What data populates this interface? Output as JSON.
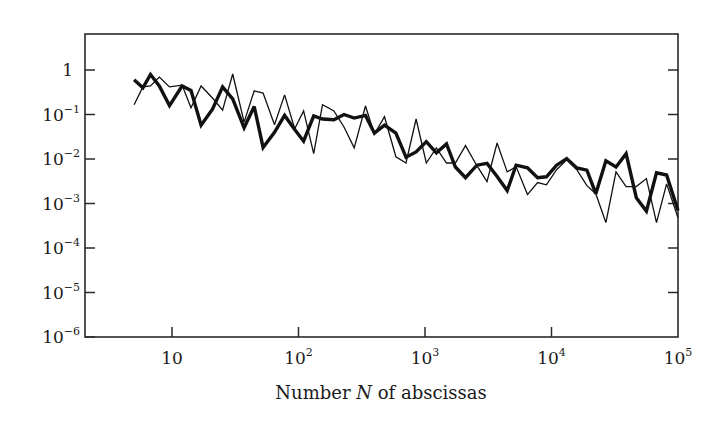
{
  "chart_data": {
    "type": "line",
    "title": "",
    "xlabel": "Number N of abscissas",
    "xlabel_parts": [
      "Number ",
      "N",
      " of abscissas"
    ],
    "ylabel": "",
    "xscale": "log",
    "yscale": "log",
    "xlim": [
      2.6,
      100000
    ],
    "ylim": [
      1e-06,
      6.5
    ],
    "grid": false,
    "legend": null,
    "x_ticks": [
      {
        "value": 1,
        "base": "10",
        "exp": ""
      },
      {
        "value": 2,
        "base": "10",
        "exp": "2"
      },
      {
        "value": 3,
        "base": "10",
        "exp": "3"
      },
      {
        "value": 4,
        "base": "10",
        "exp": "4"
      },
      {
        "value": 5,
        "base": "10",
        "exp": "5"
      }
    ],
    "y_ticks": [
      {
        "value": 0,
        "base": "1",
        "exp": ""
      },
      {
        "value": -1,
        "base": "10",
        "exp": "−1"
      },
      {
        "value": -2,
        "base": "10",
        "exp": "−2"
      },
      {
        "value": -3,
        "base": "10",
        "exp": "−3"
      },
      {
        "value": -4,
        "base": "10",
        "exp": "−4"
      },
      {
        "value": -5,
        "base": "10",
        "exp": "−5"
      },
      {
        "value": -6,
        "base": "10",
        "exp": "−6"
      }
    ],
    "series": [
      {
        "name": "thin",
        "style": "thin",
        "stroke_width": 1.3,
        "log10_x": [
          0.7,
          0.77,
          0.83,
          0.9,
          0.98,
          1.08,
          1.15,
          1.23,
          1.32,
          1.4,
          1.48,
          1.57,
          1.65,
          1.72,
          1.81,
          1.89,
          1.97,
          2.04,
          2.12,
          2.19,
          2.28,
          2.36,
          2.44,
          2.53,
          2.6,
          2.68,
          2.77,
          2.85,
          2.93,
          3.01,
          3.09,
          3.17,
          3.24,
          3.32,
          3.41,
          3.49,
          3.57,
          3.65,
          3.72,
          3.81,
          3.89,
          3.96,
          4.04,
          4.12,
          4.2,
          4.28,
          4.35,
          4.43,
          4.51,
          4.59,
          4.67,
          4.75,
          4.83,
          4.91,
          5.0
        ],
        "log10_y": [
          -0.78,
          -0.38,
          -0.36,
          -0.16,
          -0.38,
          -0.34,
          -0.85,
          -0.36,
          -0.63,
          -0.9,
          -0.09,
          -1.17,
          -0.47,
          -0.52,
          -1.23,
          -0.56,
          -1.32,
          -0.92,
          -1.88,
          -0.78,
          -0.92,
          -1.28,
          -1.75,
          -0.81,
          -1.44,
          -1.05,
          -1.95,
          -2.09,
          -1.1,
          -2.09,
          -1.75,
          -2.09,
          -2.09,
          -1.7,
          -2.15,
          -2.51,
          -1.64,
          -2.29,
          -2.17,
          -2.8,
          -2.53,
          -2.58,
          -2.24,
          -2.02,
          -2.24,
          -2.6,
          -2.78,
          -3.43,
          -2.29,
          -2.62,
          -2.62,
          -2.44,
          -3.43,
          -2.56,
          -3.32
        ]
      },
      {
        "name": "thick",
        "style": "thick",
        "stroke_width": 3.4,
        "log10_x": [
          0.7,
          0.77,
          0.83,
          0.9,
          0.98,
          1.08,
          1.15,
          1.23,
          1.32,
          1.4,
          1.48,
          1.57,
          1.65,
          1.72,
          1.81,
          1.89,
          1.97,
          2.04,
          2.12,
          2.19,
          2.28,
          2.36,
          2.44,
          2.53,
          2.6,
          2.68,
          2.77,
          2.85,
          2.93,
          3.01,
          3.09,
          3.17,
          3.24,
          3.32,
          3.41,
          3.49,
          3.57,
          3.65,
          3.72,
          3.81,
          3.89,
          3.96,
          4.04,
          4.12,
          4.2,
          4.28,
          4.35,
          4.43,
          4.51,
          4.59,
          4.67,
          4.75,
          4.83,
          4.91,
          5.0
        ],
        "log10_y": [
          -0.22,
          -0.4,
          -0.1,
          -0.36,
          -0.8,
          -0.36,
          -0.46,
          -1.24,
          -0.88,
          -0.38,
          -0.65,
          -1.3,
          -0.82,
          -1.74,
          -1.4,
          -1.02,
          -1.34,
          -1.6,
          -1.03,
          -1.1,
          -1.12,
          -1.0,
          -1.08,
          -1.02,
          -1.42,
          -1.24,
          -1.42,
          -1.96,
          -1.84,
          -1.61,
          -1.86,
          -1.66,
          -2.18,
          -2.42,
          -2.14,
          -2.1,
          -2.39,
          -2.71,
          -2.14,
          -2.2,
          -2.42,
          -2.4,
          -2.14,
          -1.99,
          -2.2,
          -2.25,
          -2.78,
          -2.04,
          -2.18,
          -1.88,
          -2.87,
          -3.17,
          -2.31,
          -2.36,
          -3.16
        ]
      }
    ],
    "colors": {
      "line": "#111111",
      "frame": "#2a2a2a",
      "background": "#ffffff"
    }
  }
}
